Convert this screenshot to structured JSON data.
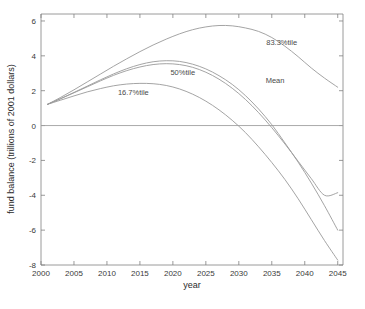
{
  "chart_data": {
    "type": "line",
    "title": "",
    "xlabel": "year",
    "ylabel": "fund balance (trillions of 2001 dollars)",
    "xlim": [
      2000,
      2045.8
    ],
    "ylim": [
      -8,
      6.4
    ],
    "xticks": [
      "2000",
      "2005",
      "2010",
      "2015",
      "2020",
      "2025",
      "2030",
      "2035",
      "2040",
      "2045"
    ],
    "xtick_values": [
      2000,
      2005,
      2010,
      2015,
      2020,
      2025,
      2030,
      2035,
      2040,
      2045
    ],
    "yticks": [
      "6",
      "4",
      "2",
      "0",
      "-2",
      "-4",
      "-6",
      "-8"
    ],
    "ytick_values": [
      6,
      4,
      2,
      0,
      -2,
      -4,
      -6,
      -8
    ],
    "grid": false,
    "legend_position": "inline-annotations",
    "zero_reference_line": 0,
    "x": [
      2001,
      2003,
      2005,
      2007,
      2009,
      2011,
      2013,
      2015,
      2017,
      2019,
      2021,
      2023,
      2025,
      2027,
      2029,
      2031,
      2033,
      2035,
      2037,
      2039,
      2041,
      2043,
      2045
    ],
    "series": [
      {
        "name": "83.3%tile",
        "label": "83.3%tile",
        "label_x": 2036.5,
        "label_y": 4.62,
        "values": [
          1.22,
          1.62,
          2.05,
          2.5,
          2.95,
          3.4,
          3.83,
          4.24,
          4.62,
          4.96,
          5.26,
          5.5,
          5.66,
          5.74,
          5.72,
          5.6,
          5.4,
          5.05,
          4.55,
          3.95,
          3.3,
          2.72,
          2.2
        ]
      },
      {
        "name": "Mean",
        "label": "Mean",
        "label_x": 2035.5,
        "label_y": 2.45,
        "values": [
          1.22,
          1.55,
          1.9,
          2.26,
          2.62,
          2.96,
          3.26,
          3.5,
          3.66,
          3.72,
          3.68,
          3.52,
          3.25,
          2.86,
          2.36,
          1.72,
          0.95,
          0.05,
          -1.0,
          -2.1,
          -3.3,
          -4.6,
          -6.0
        ]
      },
      {
        "name": "50%tile",
        "label": "50%tile",
        "label_x": 2021.5,
        "label_y": 2.9,
        "values": [
          1.22,
          1.54,
          1.88,
          2.22,
          2.56,
          2.88,
          3.15,
          3.36,
          3.5,
          3.55,
          3.5,
          3.34,
          3.06,
          2.66,
          2.14,
          1.5,
          0.74,
          -0.12,
          -1.06,
          -2.05,
          -3.05,
          -4.0,
          -3.85
        ]
      },
      {
        "name": "16.7%tile",
        "label": "16.7%tile",
        "label_x": 2014.0,
        "label_y": 1.78,
        "values": [
          1.22,
          1.46,
          1.7,
          1.93,
          2.12,
          2.28,
          2.38,
          2.42,
          2.4,
          2.3,
          2.1,
          1.8,
          1.4,
          0.9,
          0.3,
          -0.4,
          -1.22,
          -2.12,
          -3.1,
          -4.2,
          -5.4,
          -6.6,
          -7.72
        ]
      }
    ]
  },
  "caption": {
    "partial_text": ""
  }
}
